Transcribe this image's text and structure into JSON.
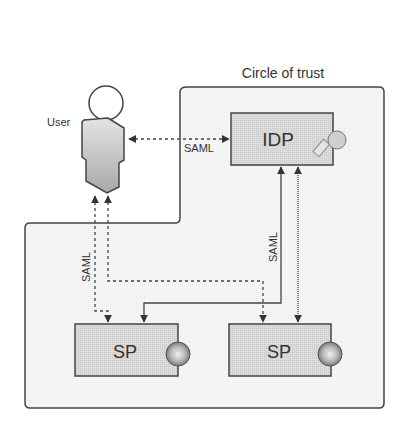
{
  "diagram": {
    "region_label": "Circle of trust",
    "user_label": "User",
    "idp_label": "IDP",
    "sp_left_label": "SP",
    "sp_right_label": "SP",
    "protocol_labels": {
      "user_idp": "SAML",
      "user_sp": "SAML",
      "idp_sp": "SAML"
    },
    "icons": {
      "idp": "key-icon",
      "sp": "globe-icon",
      "user": "person-icon"
    },
    "colors": {
      "border": "#444444",
      "box_fill": "#d9d9d9",
      "region_fill": "#f4f4f4",
      "text": "#333333"
    }
  }
}
